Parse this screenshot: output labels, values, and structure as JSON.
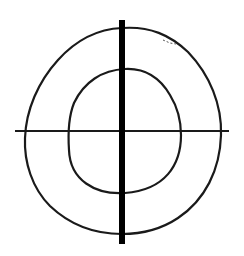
{
  "diagram": {
    "title": "",
    "description": "Hand-drawn crosshair with two nested closed loops",
    "background": "#ffffff",
    "stroke_color": "#1a1a1a",
    "elements": [
      {
        "id": "outer-loop",
        "type": "closed-curve",
        "label": ""
      },
      {
        "id": "inner-loop",
        "type": "closed-curve",
        "label": ""
      },
      {
        "id": "horizontal-axis",
        "type": "line",
        "label": ""
      },
      {
        "id": "vertical-axis",
        "type": "thick-line",
        "label": ""
      }
    ]
  }
}
